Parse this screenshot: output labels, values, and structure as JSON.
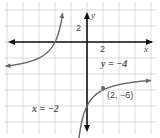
{
  "chart_data": {
    "type": "line",
    "title": "",
    "function": "y = -8/(x+2) - 4",
    "xlabel": "x",
    "ylabel": "y",
    "xlim": [
      -11,
      8
    ],
    "ylim": [
      -11,
      4
    ],
    "grid": true,
    "grid_step": 2,
    "tick_labels": {
      "x": [
        "2"
      ],
      "y": [
        "2"
      ]
    },
    "asymptotes": {
      "vertical": {
        "x": -2,
        "label": "x = −2"
      },
      "horizontal": {
        "y": -4,
        "label": "y = −4"
      }
    },
    "points": [
      {
        "x": 2,
        "y": -6,
        "label": "(2, −6)"
      }
    ],
    "series": [
      {
        "name": "left branch",
        "x": [
          -10,
          -8,
          -6,
          -4,
          -3
        ],
        "y": [
          -3,
          -2.67,
          -2,
          0,
          4
        ]
      },
      {
        "name": "right branch",
        "x": [
          -1.2,
          -1,
          0,
          2,
          4,
          8
        ],
        "y": [
          -14,
          -12,
          -8,
          -6,
          -5.33,
          -4.8
        ]
      }
    ],
    "colors": {
      "axis": "#111111",
      "curve": "#666666",
      "grid": "#d0d0d0",
      "point": "#666666",
      "label": "#444444"
    }
  },
  "labels": {
    "x_axis": "x",
    "y_axis": "y",
    "x_tick": "2",
    "y_tick": "2",
    "h_asymptote": "y = −4",
    "v_asymptote": "x = −2",
    "point": "(2, −6)"
  }
}
